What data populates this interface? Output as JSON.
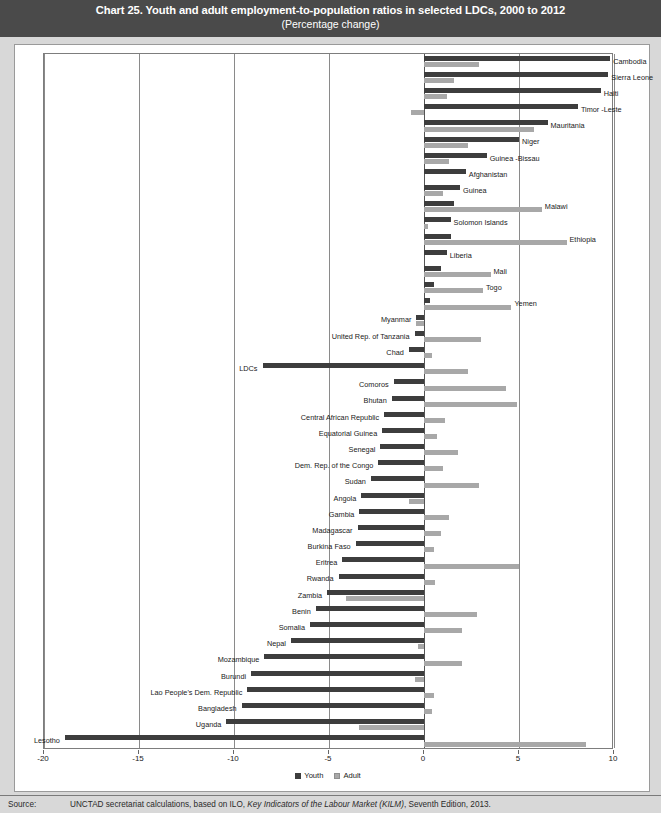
{
  "title": {
    "main": "Chart 25. Youth and adult employment-to-population ratios in selected LDCs, 2000 to 2012",
    "subtitle": "(Percentage change)"
  },
  "source": {
    "label": "Source:",
    "text_before": "UNCTAD secretariat calculations, based on ILO, ",
    "text_italic": "Key Indicators of the Labour Market (KILM)",
    "text_after": ", Seventh Edition, 2013."
  },
  "legend": {
    "position": "bottom-center",
    "items": [
      {
        "name": "Youth",
        "color": "#3d3d3d"
      },
      {
        "name": "Adult",
        "color": "#a8a8a8"
      }
    ]
  },
  "axis": {
    "ticks": [
      "-20",
      "-15",
      "-10",
      "-5",
      "0",
      "5",
      "10"
    ],
    "min": -20,
    "max": 10,
    "grid": true
  },
  "chart_data": {
    "type": "bar",
    "orientation": "horizontal",
    "title": "Chart 25. Youth and adult employment-to-population ratios in selected LDCs, 2000 to 2012",
    "subtitle": "(Percentage change)",
    "xlabel": "Percentage change",
    "ylabel": "",
    "xlim": [
      -20,
      10
    ],
    "grid": true,
    "legend_position": "bottom-center",
    "categories": [
      "Cambodia",
      "Sierra Leone",
      "Haiti",
      "Timor -Leste",
      "Mauritania",
      "Niger",
      "Guinea -Bissau",
      "Afghanistan",
      "Guinea",
      "Malawi",
      "Solomon Islands",
      "Ethiopia",
      "Liberia",
      "Mali",
      "Togo",
      "Yemen",
      "Myanmar",
      "United Rep. of Tanzania",
      "Chad",
      "LDCs",
      "Comoros",
      "Bhutan",
      "Central African Republic",
      "Equatorial Guinea",
      "Senegal",
      "Dem. Rep. of the Congo",
      "Sudan",
      "Angola",
      "Gambia",
      "Madagascar",
      "Burkina Faso",
      "Eritrea",
      "Rwanda",
      "Zambia",
      "Benin",
      "Somalia",
      "Nepal",
      "Mozambique",
      "Burundi",
      "Lao People's Dem. Republic",
      "Bangladesh",
      "Uganda",
      "Lesotho"
    ],
    "series": [
      {
        "name": "Youth",
        "color": "#3d3d3d",
        "values": [
          9.8,
          9.7,
          9.3,
          8.1,
          6.5,
          5.0,
          3.3,
          2.2,
          1.9,
          1.6,
          1.4,
          1.4,
          1.2,
          0.9,
          0.5,
          0.3,
          -0.4,
          -0.5,
          -0.8,
          -8.5,
          -1.6,
          -1.7,
          -2.1,
          -2.2,
          -2.3,
          -2.4,
          -2.8,
          -3.3,
          -3.4,
          -3.5,
          -3.6,
          -4.3,
          -4.5,
          -5.1,
          -5.7,
          -6.0,
          -7.0,
          -8.4,
          -9.1,
          -9.3,
          -9.6,
          -10.4,
          -18.9
        ]
      },
      {
        "name": "Adult",
        "color": "#a8a8a8",
        "values": [
          2.9,
          1.6,
          1.2,
          -0.7,
          5.8,
          2.3,
          1.3,
          0.0,
          1.0,
          6.2,
          0.2,
          7.5,
          0.0,
          3.5,
          3.1,
          4.6,
          -0.4,
          3.0,
          0.4,
          2.3,
          4.3,
          4.9,
          1.1,
          0.7,
          1.8,
          1.0,
          2.9,
          -0.8,
          1.3,
          0.9,
          0.5,
          5.0,
          0.6,
          -4.1,
          2.8,
          2.0,
          -0.3,
          2.0,
          -0.5,
          0.5,
          0.4,
          -3.4,
          8.5
        ]
      }
    ]
  }
}
